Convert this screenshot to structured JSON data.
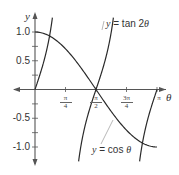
{
  "chart_data": {
    "type": "line",
    "title": "",
    "xlabel": "θ",
    "ylabel": "y",
    "x_range": [
      0,
      3.14159
    ],
    "y_range": [
      -1.2,
      1.25
    ],
    "grid": false,
    "x_ticks": [
      {
        "value": 0.7854,
        "num": "π",
        "den": "4"
      },
      {
        "value": 1.5708,
        "num": "π",
        "den": "2"
      },
      {
        "value": 2.3562,
        "num": "3π",
        "den": "4"
      },
      {
        "value": 3.14159,
        "num": "π",
        "den": ""
      }
    ],
    "y_ticks": [
      {
        "value": 1.0,
        "label": "1.0"
      },
      {
        "value": 0.5,
        "label": "0.5"
      },
      {
        "value": -0.5,
        "label": "-0.5"
      },
      {
        "value": -1.0,
        "label": "-1.0"
      }
    ],
    "series": [
      {
        "name": "y = cos θ",
        "function": "cos(theta)",
        "domain": [
          0,
          3.14159
        ]
      },
      {
        "name": "y = tan 2θ",
        "function": "tan(2*theta)",
        "domain": [
          0,
          3.14159
        ],
        "asymptotes": [
          0.7854,
          2.3562
        ]
      }
    ],
    "annotations": [
      {
        "text_prefix": "y",
        "text_eq": " = tan 2",
        "text_var": "θ",
        "target_series": "y = tan 2θ"
      },
      {
        "text_prefix": "y",
        "text_eq": " = cos ",
        "text_var": "θ",
        "target_series": "y = cos θ"
      }
    ]
  },
  "colors": {
    "axis": "#555555",
    "curve": "#2a2a2a",
    "text": "#333333"
  }
}
